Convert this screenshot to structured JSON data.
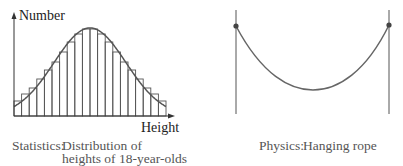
{
  "chart_data": [
    {
      "type": "bar",
      "subtype": "histogram-with-curve",
      "title": "",
      "xlabel": "Height",
      "ylabel": "Number",
      "categories": [
        "1",
        "2",
        "3",
        "4",
        "5",
        "6",
        "7",
        "8",
        "9",
        "10",
        "11",
        "12",
        "13",
        "14",
        "15",
        "16",
        "17",
        "18",
        "19",
        "20"
      ],
      "values": [
        15,
        22,
        28,
        37,
        46,
        54,
        64,
        74,
        82,
        87,
        87,
        82,
        74,
        64,
        54,
        46,
        37,
        28,
        22,
        15
      ],
      "curve": "normal bell curve overlaying histogram",
      "grid": false,
      "legend": null,
      "caption": [
        "Statistics: Distribution of",
        "heights of 18-year-olds"
      ]
    },
    {
      "type": "line",
      "subtype": "catenary",
      "description": "Rope hanging between two vertical poles, attached at dots",
      "caption": "Physics: Hanging rope"
    }
  ],
  "left": {
    "y_axis_label": "Number",
    "x_axis_label": "Height",
    "caption_prefix": "Statistics:",
    "caption_line1": "Distribution of",
    "caption_line2": "heights of 18-year-olds"
  },
  "right": {
    "caption_prefix": "Physics:",
    "caption_text": "Hanging rope"
  },
  "colors": {
    "ink": "#333333",
    "curve": "#555555",
    "caption": "#555555"
  }
}
